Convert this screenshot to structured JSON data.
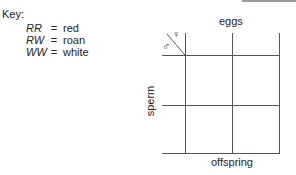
{
  "key": {
    "title": "Key:",
    "entries": [
      {
        "genotype": "RR",
        "eq": "=",
        "phenotype": "red"
      },
      {
        "genotype": "RW",
        "eq": "=",
        "phenotype": "roan"
      },
      {
        "genotype": "WW",
        "eq": "=",
        "phenotype": "white"
      }
    ]
  },
  "punnett": {
    "top_label": "eggs",
    "side_label": "sperm",
    "bottom_label": "offspring",
    "female_symbol": "♀",
    "male_symbol": "♂",
    "rows": 2,
    "cols": 2
  }
}
